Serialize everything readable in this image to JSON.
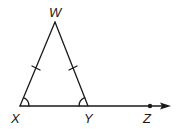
{
  "figure": {
    "type": "geometry",
    "colors": {
      "stroke": "#1a1a1a",
      "background": "#ffffff"
    }
  },
  "points": {
    "W": {
      "label": "W",
      "x": 55,
      "y": 22
    },
    "X": {
      "label": "X",
      "x": 20,
      "y": 106
    },
    "Y": {
      "label": "Y",
      "x": 88,
      "y": 106
    },
    "Z": {
      "label": "Z",
      "x": 150,
      "y": 106
    }
  },
  "segments": [
    {
      "from": "W",
      "to": "X",
      "tick_marks": 1
    },
    {
      "from": "W",
      "to": "Y",
      "tick_marks": 1
    },
    {
      "from": "X",
      "to": "Y",
      "tick_marks": 0
    }
  ],
  "ray": {
    "from": "X",
    "through": "Z",
    "arrow": true
  },
  "angle_marks": [
    {
      "vertex": "X",
      "arcs": 1
    },
    {
      "vertex": "Y",
      "arcs": 1
    }
  ]
}
